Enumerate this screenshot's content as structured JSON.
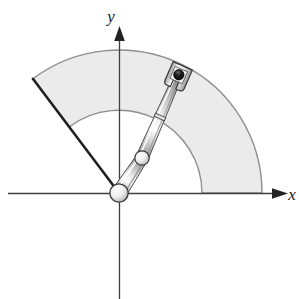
{
  "figure": {
    "type": "technical-line-diagram",
    "background_color": "#ffffff",
    "axes": {
      "x_label": "x",
      "y_label": "y",
      "axis_color": "#3a3a3a",
      "origin_px": {
        "x": 119,
        "y": 193
      },
      "x_axis": {
        "start_px": {
          "x": 8,
          "y": 193
        },
        "end_px": {
          "x": 286,
          "y": 193
        },
        "arrow": true
      },
      "y_axis": {
        "start_px": {
          "x": 119,
          "y": 299
        },
        "end_px": {
          "x": 119,
          "y": 29
        },
        "arrow": true
      }
    },
    "workspace": {
      "name": "reachable-workspace-annular-sector",
      "shape": "annular sector",
      "fill_color": "#ebebeb",
      "stroke_color": "#8c8c8c",
      "inner_radius_px": 83,
      "outer_radius_px": 143,
      "start_angle_deg": 0,
      "end_angle_deg": 127
    },
    "boundary_line": {
      "name": "workspace-limit-line",
      "color": "#262626",
      "from_px": {
        "x": 119,
        "y": 193
      },
      "to_px": {
        "x": 33,
        "y": 78
      },
      "angle_deg": 127,
      "length_px": 143
    },
    "robot": {
      "base_joint": {
        "label": "base-revolute-joint",
        "center_px": {
          "x": 119,
          "y": 193
        },
        "radius_px": 9,
        "fill_color": "#f2f2f2",
        "stroke_color": "#3a3a3a"
      },
      "link1": {
        "label": "link-1",
        "from_px": {
          "x": 119,
          "y": 193
        },
        "to_px": {
          "x": 142,
          "y": 158
        },
        "width_px": 13,
        "angle_deg": 56.7,
        "length_px": 42
      },
      "elbow_joint": {
        "label": "elbow-revolute-joint",
        "center_px": {
          "x": 142,
          "y": 158
        },
        "radius_px": 7,
        "fill_color": "#f2f2f2",
        "stroke_color": "#3a3a3a"
      },
      "link2": {
        "label": "link-2",
        "from_px": {
          "x": 142,
          "y": 158
        },
        "to_px": {
          "x": 176,
          "y": 80
        },
        "width_px": 11,
        "angle_deg": 66.4,
        "length_px": 85
      },
      "wrist_band": {
        "label": "wrist-band",
        "center_px": {
          "x": 160,
          "y": 117
        }
      },
      "gripper": {
        "label": "end-effector-gripper",
        "center_px": {
          "x": 179,
          "y": 74
        },
        "stroke_color": "#3a3a3a",
        "fill_color": "#fafafa"
      },
      "grasped_object": {
        "label": "grasped-workpiece",
        "center_px": {
          "x": 179,
          "y": 72
        },
        "radius_px": 5,
        "fill_color": "#111111"
      }
    },
    "metal_shading": {
      "highlight_color": "#fbfbfb",
      "midtone_color": "#d9d9d9",
      "shadow_color": "#9a9a9a",
      "outline_color": "#404040"
    }
  }
}
